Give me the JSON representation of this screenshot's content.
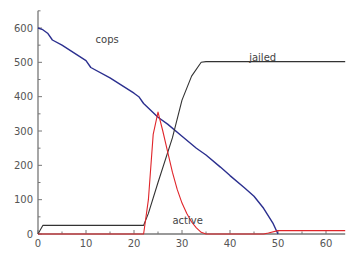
{
  "chart_data": {
    "type": "line",
    "title": "",
    "xlabel": "",
    "ylabel": "",
    "xlim": [
      0,
      64
    ],
    "ylim": [
      0,
      650
    ],
    "grid": false,
    "legend": "inline labels",
    "x_ticks": [
      0,
      10,
      20,
      30,
      40,
      50,
      60
    ],
    "y_ticks": [
      0,
      100,
      200,
      300,
      400,
      500,
      600
    ],
    "series": [
      {
        "name": "cops",
        "color": "#2b2f8f",
        "label_pos": [
          12,
          555
        ],
        "points": [
          [
            0,
            600
          ],
          [
            1,
            595
          ],
          [
            2,
            585
          ],
          [
            3,
            565
          ],
          [
            5,
            550
          ],
          [
            10,
            505
          ],
          [
            11,
            485
          ],
          [
            15,
            455
          ],
          [
            20,
            410
          ],
          [
            21,
            400
          ],
          [
            22,
            380
          ],
          [
            25,
            340
          ],
          [
            27,
            320
          ],
          [
            30,
            285
          ],
          [
            33,
            250
          ],
          [
            35,
            230
          ],
          [
            38,
            195
          ],
          [
            40,
            170
          ],
          [
            43,
            135
          ],
          [
            45,
            110
          ],
          [
            47,
            75
          ],
          [
            49,
            30
          ],
          [
            50,
            0
          ]
        ]
      },
      {
        "name": "jailed",
        "color": "#333333",
        "label_pos": [
          44,
          505
        ],
        "points": [
          [
            0,
            0
          ],
          [
            1,
            25
          ],
          [
            22,
            25
          ],
          [
            23,
            60
          ],
          [
            25,
            150
          ],
          [
            28,
            280
          ],
          [
            30,
            390
          ],
          [
            32,
            460
          ],
          [
            34,
            500
          ],
          [
            35,
            502
          ],
          [
            64,
            502
          ]
        ]
      },
      {
        "name": "active",
        "color": "#e0252a",
        "label_pos": [
          28,
          30
        ],
        "points": [
          [
            0,
            0
          ],
          [
            22,
            0
          ],
          [
            23,
            100
          ],
          [
            24,
            290
          ],
          [
            25,
            355
          ],
          [
            26,
            300
          ],
          [
            27,
            240
          ],
          [
            28,
            180
          ],
          [
            29,
            130
          ],
          [
            30,
            90
          ],
          [
            31,
            60
          ],
          [
            32,
            35
          ],
          [
            33,
            18
          ],
          [
            34,
            5
          ],
          [
            35,
            0
          ],
          [
            47,
            0
          ],
          [
            48,
            3
          ],
          [
            50,
            10
          ],
          [
            64,
            10
          ]
        ]
      }
    ]
  }
}
